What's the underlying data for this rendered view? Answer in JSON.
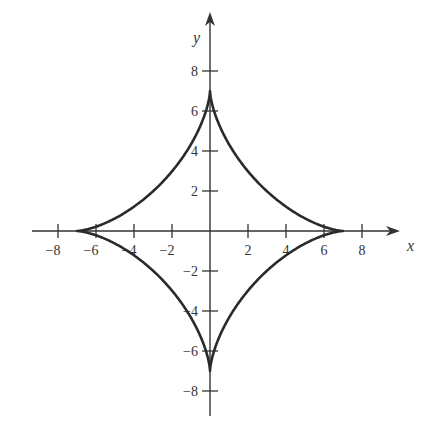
{
  "chart_data": {
    "type": "line",
    "title": "",
    "xlabel": "x",
    "ylabel": "y",
    "curve": "astroid",
    "equation": "x^(2/3) + y^(2/3) = 7^(2/3)",
    "parametric": {
      "x": "7cos^3(t)",
      "y": "7sin^3(t)",
      "t_range": [
        0,
        6.2832
      ]
    },
    "x_ticks": [
      -8,
      -6,
      -4,
      -2,
      2,
      4,
      6,
      8
    ],
    "y_ticks": [
      -8,
      -6,
      -4,
      -2,
      2,
      4,
      6,
      8
    ],
    "x_tick_labels": [
      "−8",
      "−6",
      "−4",
      "−2",
      "2",
      "4",
      "6",
      "8"
    ],
    "y_tick_labels": [
      "−8",
      "−6",
      "−4",
      "−2",
      "2",
      "4",
      "6",
      "8"
    ],
    "xlim": [
      -9,
      9.5
    ],
    "ylim": [
      -9.2,
      9.5
    ],
    "cusps": [
      [
        7,
        0
      ],
      [
        0,
        7
      ],
      [
        -7,
        0
      ],
      [
        0,
        -7
      ]
    ],
    "grid": false,
    "legend": null
  },
  "axes": {
    "x_label": "x",
    "y_label": "y"
  },
  "colors": {
    "curve": "#2a2a2a",
    "axes": "#333333",
    "text": "#333333"
  }
}
